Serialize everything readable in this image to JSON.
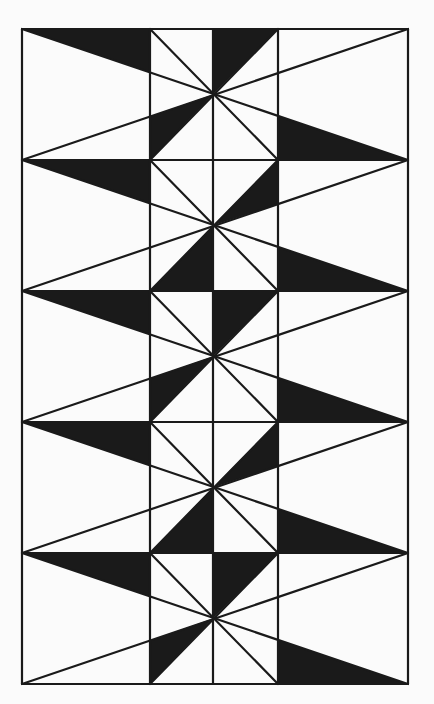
{
  "figure": {
    "background_color": "#fbfbfb",
    "ink_color": "#1a1a1a",
    "stroke_width": 2.2,
    "frame": {
      "left": 22,
      "top": 29,
      "right": 408,
      "bottom": 684
    },
    "column_lines_x": [
      150,
      213,
      278
    ],
    "band_height": 131,
    "bands": [
      {
        "index": 1,
        "pattern": "A"
      },
      {
        "index": 2,
        "pattern": "B"
      },
      {
        "index": 3,
        "pattern": "A"
      },
      {
        "index": 4,
        "pattern": "B"
      },
      {
        "index": 5,
        "pattern": "A"
      }
    ]
  }
}
